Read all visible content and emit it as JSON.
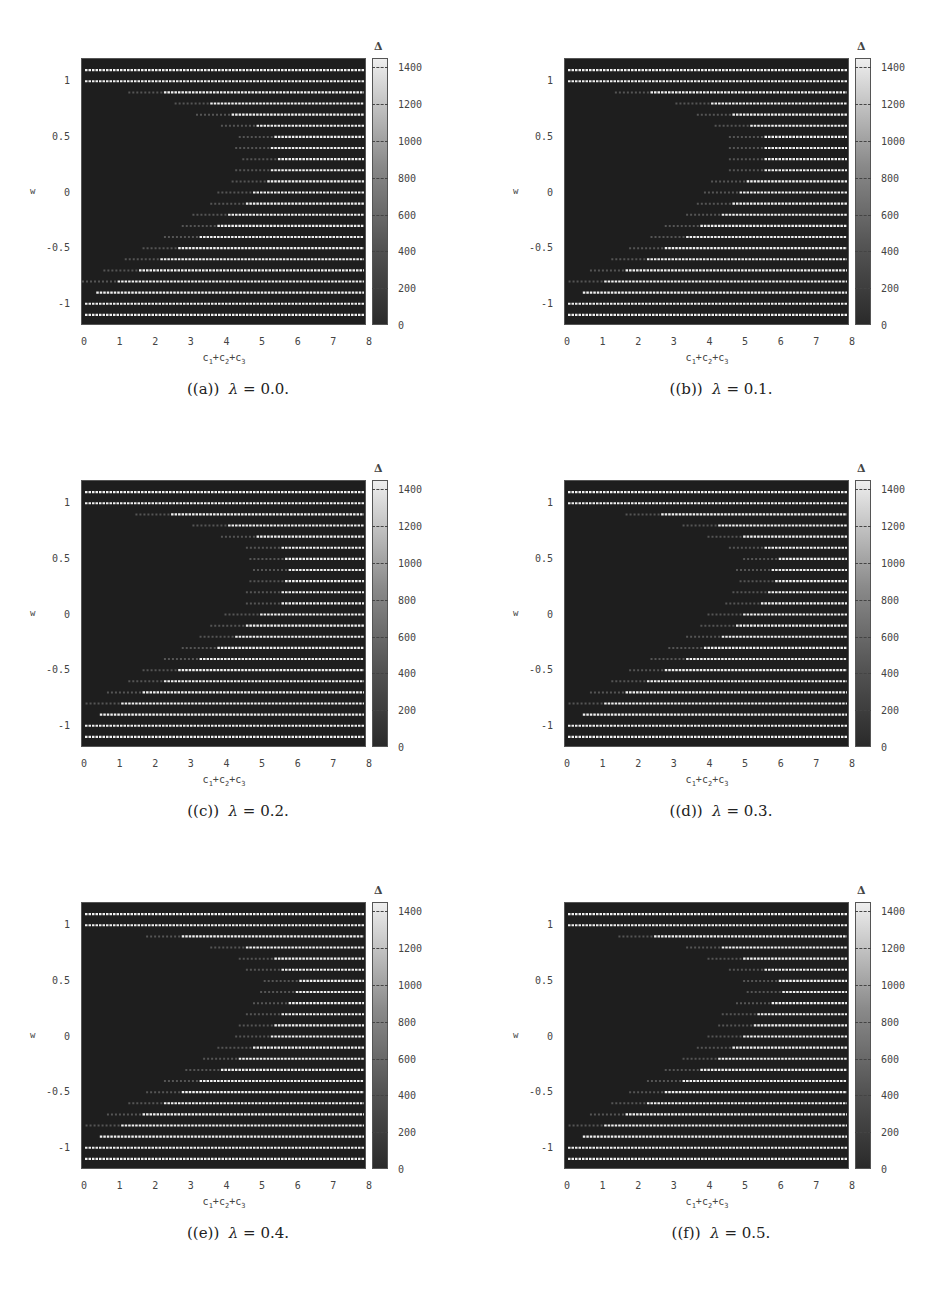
{
  "chart_data": [
    {
      "type": "heatmap",
      "panel": "a",
      "caption_label": "((a))",
      "caption_eq": "λ = 0.0.",
      "lambda": 0.0,
      "xlabel": "c1+c2+c3",
      "ylabel": "w",
      "colorbar_title": "Δ",
      "xlim": [
        0,
        8
      ],
      "ylim": [
        -1.2,
        1.2
      ],
      "w_rows": [
        1.1,
        1.0,
        0.9,
        0.8,
        0.7,
        0.6,
        0.5,
        0.4,
        0.3,
        0.2,
        0.1,
        0.0,
        -0.1,
        -0.2,
        -0.3,
        -0.4,
        -0.5,
        -0.6,
        -0.7,
        -0.8,
        -0.9,
        -1.0,
        -1.1
      ],
      "bright_start_x": [
        0,
        0,
        2.3,
        3.6,
        4.2,
        4.9,
        5.4,
        5.3,
        5.5,
        5.3,
        5.2,
        4.8,
        4.6,
        4.1,
        3.8,
        3.3,
        2.7,
        2.2,
        1.6,
        1.0,
        0.4,
        0,
        0
      ]
    },
    {
      "type": "heatmap",
      "panel": "b",
      "caption_label": "((b))",
      "caption_eq": "λ = 0.1.",
      "lambda": 0.1,
      "xlabel": "c1+c2+c3",
      "ylabel": "w",
      "colorbar_title": "Δ",
      "xlim": [
        0,
        8
      ],
      "ylim": [
        -1.2,
        1.2
      ],
      "w_rows": [
        1.1,
        1.0,
        0.9,
        0.8,
        0.7,
        0.6,
        0.5,
        0.4,
        0.3,
        0.2,
        0.1,
        0.0,
        -0.1,
        -0.2,
        -0.3,
        -0.4,
        -0.5,
        -0.6,
        -0.7,
        -0.8,
        -0.9,
        -1.0,
        -1.1
      ],
      "bright_start_x": [
        0,
        0,
        2.4,
        4.1,
        4.7,
        5.2,
        5.6,
        5.6,
        5.6,
        5.6,
        5.1,
        4.9,
        4.7,
        4.4,
        3.8,
        3.4,
        2.8,
        2.3,
        1.7,
        1.1,
        0.5,
        0,
        0
      ]
    },
    {
      "type": "heatmap",
      "panel": "c",
      "caption_label": "((c))",
      "caption_eq": "λ = 0.2.",
      "lambda": 0.2,
      "xlabel": "c1+c2+c3",
      "ylabel": "w",
      "colorbar_title": "Δ",
      "xlim": [
        0,
        8
      ],
      "ylim": [
        -1.2,
        1.2
      ],
      "w_rows": [
        1.1,
        1.0,
        0.9,
        0.8,
        0.7,
        0.6,
        0.5,
        0.4,
        0.3,
        0.2,
        0.1,
        0.0,
        -0.1,
        -0.2,
        -0.3,
        -0.4,
        -0.5,
        -0.6,
        -0.7,
        -0.8,
        -0.9,
        -1.0,
        -1.1
      ],
      "bright_start_x": [
        0,
        0,
        2.5,
        4.1,
        4.9,
        5.6,
        5.7,
        5.8,
        5.7,
        5.6,
        5.6,
        5.0,
        4.6,
        4.3,
        3.8,
        3.3,
        2.7,
        2.3,
        1.7,
        1.1,
        0.5,
        0,
        0
      ]
    },
    {
      "type": "heatmap",
      "panel": "d",
      "caption_label": "((d))",
      "caption_eq": "λ = 0.3.",
      "lambda": 0.3,
      "xlabel": "c1+c2+c3",
      "ylabel": "w",
      "colorbar_title": "Δ",
      "xlim": [
        0,
        8
      ],
      "ylim": [
        -1.2,
        1.2
      ],
      "w_rows": [
        1.1,
        1.0,
        0.9,
        0.8,
        0.7,
        0.6,
        0.5,
        0.4,
        0.3,
        0.2,
        0.1,
        0.0,
        -0.1,
        -0.2,
        -0.3,
        -0.4,
        -0.5,
        -0.6,
        -0.7,
        -0.8,
        -0.9,
        -1.0,
        -1.1
      ],
      "bright_start_x": [
        0,
        0,
        2.7,
        4.3,
        5.0,
        5.6,
        6.0,
        5.8,
        5.9,
        5.7,
        5.5,
        5.0,
        4.8,
        4.4,
        3.9,
        3.4,
        2.8,
        2.3,
        1.7,
        1.1,
        0.5,
        0,
        0
      ]
    },
    {
      "type": "heatmap",
      "panel": "e",
      "caption_label": "((e))",
      "caption_eq": "λ = 0.4.",
      "lambda": 0.4,
      "xlabel": "c1+c2+c3",
      "ylabel": "w",
      "colorbar_title": "Δ",
      "xlim": [
        0,
        8
      ],
      "ylim": [
        -1.2,
        1.2
      ],
      "w_rows": [
        1.1,
        1.0,
        0.9,
        0.8,
        0.7,
        0.6,
        0.5,
        0.4,
        0.3,
        0.2,
        0.1,
        0.0,
        -0.1,
        -0.2,
        -0.3,
        -0.4,
        -0.5,
        -0.6,
        -0.7,
        -0.8,
        -0.9,
        -1.0,
        -1.1
      ],
      "bright_start_x": [
        0,
        0,
        2.8,
        4.6,
        5.4,
        5.6,
        6.1,
        6.0,
        5.8,
        5.6,
        5.4,
        5.3,
        4.8,
        4.4,
        3.9,
        3.3,
        2.8,
        2.3,
        1.7,
        1.1,
        0.5,
        0,
        0
      ]
    },
    {
      "type": "heatmap",
      "panel": "f",
      "caption_label": "((f))",
      "caption_eq": "λ = 0.5.",
      "lambda": 0.5,
      "xlabel": "c1+c2+c3",
      "ylabel": "w",
      "colorbar_title": "Δ",
      "xlim": [
        0,
        8
      ],
      "ylim": [
        -1.2,
        1.2
      ],
      "w_rows": [
        1.1,
        1.0,
        0.9,
        0.8,
        0.7,
        0.6,
        0.5,
        0.4,
        0.3,
        0.2,
        0.1,
        0.0,
        -0.1,
        -0.2,
        -0.3,
        -0.4,
        -0.5,
        -0.6,
        -0.7,
        -0.8,
        -0.9,
        -1.0,
        -1.1
      ],
      "bright_start_x": [
        0,
        0,
        2.5,
        4.4,
        5.0,
        5.6,
        6.0,
        6.1,
        5.8,
        5.4,
        5.3,
        5.0,
        4.7,
        4.3,
        3.8,
        3.3,
        2.8,
        2.3,
        1.7,
        1.1,
        0.5,
        0,
        0
      ]
    }
  ],
  "axes": {
    "x_ticks": [
      "0",
      "1",
      "2",
      "3",
      "4",
      "5",
      "6",
      "7",
      "8"
    ],
    "y_ticks": [
      {
        "label": "1",
        "value": 1
      },
      {
        "label": "0.5",
        "value": 0.5
      },
      {
        "label": "0",
        "value": 0
      },
      {
        "label": "-0.5",
        "value": -0.5
      },
      {
        "label": "-1",
        "value": -1
      }
    ],
    "ylabel": "w",
    "xlabel_parts": [
      "c",
      "1",
      "+c",
      "2",
      "+c",
      "3"
    ],
    "colorbar_title": "Δ",
    "colorbar_ticks": [
      "1400",
      "1200",
      "1000",
      "800",
      "600",
      "400",
      "200",
      "0"
    ],
    "colorbar_range": [
      0,
      1450
    ]
  },
  "panels": [
    {
      "caption_label": "((a))",
      "caption_lambda": "λ",
      "caption_rest": " = 0.0."
    },
    {
      "caption_label": "((b))",
      "caption_lambda": "λ",
      "caption_rest": " = 0.1."
    },
    {
      "caption_label": "((c))",
      "caption_lambda": "λ",
      "caption_rest": " = 0.2."
    },
    {
      "caption_label": "((d))",
      "caption_lambda": "λ",
      "caption_rest": " = 0.3."
    },
    {
      "caption_label": "((e))",
      "caption_lambda": "λ",
      "caption_rest": " = 0.4."
    },
    {
      "caption_label": "((f))",
      "caption_lambda": "λ",
      "caption_rest": " = 0.5."
    }
  ],
  "colors": {
    "background_low": "#1e1e1e",
    "bar_high": "#f0f0f0",
    "bar_mid": "#7a7a7a"
  }
}
